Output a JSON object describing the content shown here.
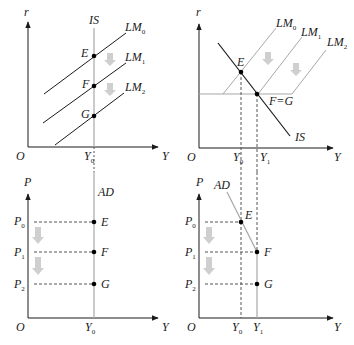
{
  "colors": {
    "ink": "#1a1a1a",
    "gray_line": "#a8a8a8",
    "arrow_gray": "#cfcfcf",
    "point": "#000000"
  },
  "panels": {
    "top_left": {
      "y_axis": "r",
      "x_axis": "Y",
      "origin": "O",
      "curves": [
        "IS",
        "LM",
        "LM",
        "LM"
      ],
      "curve_subs": [
        "0",
        "1",
        "2"
      ],
      "is_label": "IS",
      "lm_label": "LM",
      "points": [
        "E",
        "F",
        "G"
      ],
      "x_tick": "Y",
      "x_tick_sub": "0"
    },
    "top_right": {
      "y_axis": "r",
      "x_axis": "Y",
      "origin": "O",
      "is_label": "IS",
      "lm_label": "LM",
      "lm_subs": [
        "0",
        "1",
        "2"
      ],
      "point_e": "E",
      "point_fg": "F=G",
      "x_tick": "Y",
      "x_tick_subs": [
        "0",
        "1"
      ]
    },
    "bottom_left": {
      "y_axis": "P",
      "x_axis": "Y",
      "origin": "O",
      "ad_label": "AD",
      "p_label": "P",
      "p_subs": [
        "0",
        "1",
        "2"
      ],
      "points": [
        "E",
        "F",
        "G"
      ],
      "x_tick": "Y",
      "x_tick_sub": "0"
    },
    "bottom_right": {
      "y_axis": "P",
      "x_axis": "Y",
      "origin": "O",
      "ad_label": "AD",
      "p_label": "P",
      "p_subs": [
        "0",
        "1",
        "2"
      ],
      "points": [
        "E",
        "F",
        "G"
      ],
      "x_tick": "Y",
      "x_tick_subs": [
        "0",
        "1"
      ]
    }
  }
}
